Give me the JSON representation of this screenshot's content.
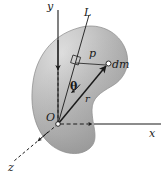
{
  "figure": {
    "background_color": "#ffffff",
    "width": 167,
    "height": 176,
    "body_fill_light": "#cfcfcf",
    "body_fill_mid": "#b4b4b4",
    "body_fill_dark": "#8f8f8f",
    "line_color": "#1a1a1a",
    "labels": {
      "y_axis": "y",
      "x_axis": "x",
      "z_axis": "z",
      "axis_L": "L",
      "perpendicular_distance": "p",
      "mass_element": "dm",
      "angle_theta": "θ",
      "radius_r": "r",
      "origin": "O"
    },
    "icons": {
      "mass_point": "small-open-circle-marker",
      "origin_point": "small-open-circle-marker",
      "right_angle": "right-angle-square-marker"
    },
    "geometry": {
      "origin": [
        58,
        124
      ],
      "mass_element_point": [
        108,
        64
      ],
      "perpendicular_foot": [
        76,
        62
      ],
      "y_axis_top": [
        58,
        10
      ],
      "y_axis_arrow_tip": [
        58,
        72
      ],
      "x_axis_right_end": [
        161,
        124
      ],
      "z_axis_end": [
        14,
        162
      ],
      "axis_L_top": [
        88,
        16
      ],
      "axis_L_bottom": [
        58,
        124
      ]
    }
  }
}
